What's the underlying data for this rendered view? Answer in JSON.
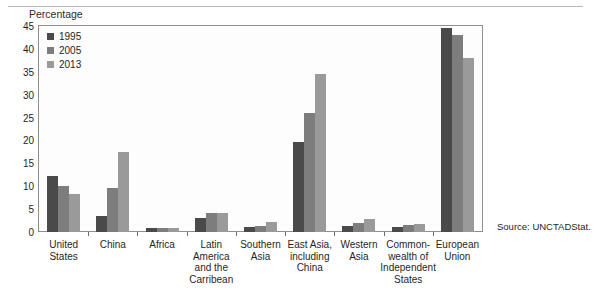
{
  "axis_title": "Percentage",
  "source_note": "Source:  UNCTADStat.",
  "top_ghost": "",
  "legend": {
    "items": [
      {
        "label": "1995",
        "color": "#4a4a4a"
      },
      {
        "label": "2005",
        "color": "#7d7d7d"
      },
      {
        "label": "2013",
        "color": "#9a9a9a"
      }
    ]
  },
  "chart_data": {
    "type": "bar",
    "title": "",
    "subtitle": "",
    "xlabel": "",
    "ylabel": "Percentage",
    "ylim": [
      0,
      45
    ],
    "yticks": [
      0,
      5,
      10,
      15,
      20,
      25,
      30,
      35,
      40,
      45
    ],
    "grid": false,
    "legend_position": "top-left",
    "categories": [
      "United States",
      "China",
      "Africa",
      "Latin America and the Carribean",
      "Southern Asia",
      "East Asia, including China",
      "Western Asia",
      "Commonwealth of Independent States",
      "European Union"
    ],
    "category_label_lines": [
      [
        "United",
        "States"
      ],
      [
        "China"
      ],
      [
        "Africa"
      ],
      [
        "Latin",
        "America",
        "and the",
        "Carribean"
      ],
      [
        "Southern",
        "Asia"
      ],
      [
        "East Asia,",
        "including",
        "China"
      ],
      [
        "Western",
        "Asia"
      ],
      [
        "Common-",
        "wealth of",
        "Independent",
        "States"
      ],
      [
        "European",
        "Union"
      ]
    ],
    "series": [
      {
        "name": "1995",
        "color": "#4a4a4a",
        "values": [
          12.2,
          3.4,
          0.9,
          3.1,
          1.1,
          19.7,
          1.3,
          1.2,
          44.5
        ]
      },
      {
        "name": "2005",
        "color": "#7d7d7d",
        "values": [
          10.0,
          9.6,
          0.9,
          4.2,
          1.4,
          25.9,
          2.0,
          1.5,
          43.0
        ]
      },
      {
        "name": "2013",
        "color": "#9a9a9a",
        "values": [
          8.4,
          17.4,
          0.9,
          4.2,
          2.2,
          34.5,
          2.8,
          1.7,
          38.0
        ]
      }
    ]
  }
}
